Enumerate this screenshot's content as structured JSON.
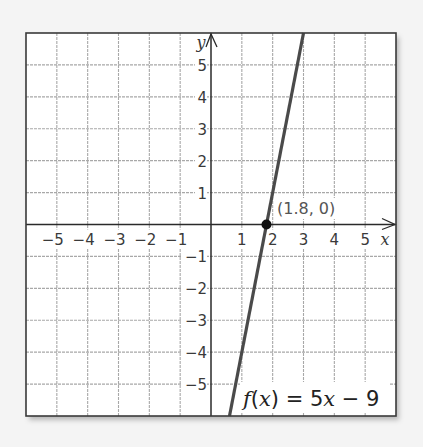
{
  "chart_data": {
    "type": "line",
    "title": "",
    "xlabel": "x",
    "ylabel": "y",
    "xlim": [
      -6,
      6
    ],
    "ylim": [
      -6,
      6
    ],
    "grid": true,
    "x_ticks": [
      -5,
      -4,
      -3,
      -2,
      -1,
      1,
      2,
      3,
      4,
      5
    ],
    "y_ticks": [
      5,
      4,
      3,
      2,
      1,
      -1,
      -2,
      -3,
      -4,
      -5
    ],
    "x_tick_labels": [
      "−5",
      "−4",
      "−3",
      "−2",
      "−1",
      "1",
      "2",
      "3",
      "4",
      "5"
    ],
    "y_tick_labels": [
      "5",
      "4",
      "3",
      "2",
      "1",
      "−1",
      "−2",
      "−3",
      "−4",
      "−5"
    ],
    "series": [
      {
        "name": "f(x) = 5x − 9",
        "equation": "f(x) = 5x - 9",
        "slope": 5,
        "intercept": -9,
        "x": [
          0.6,
          3
        ],
        "y": [
          -6,
          6
        ]
      }
    ],
    "annotations": [
      {
        "type": "point",
        "x": 1.8,
        "y": 0,
        "label": "(1.8, 0)"
      }
    ]
  },
  "labels": {
    "x_axis": "x",
    "y_axis": "y",
    "point": "(1.8, 0)",
    "equation_f": "f",
    "equation_open": "(",
    "equation_x": "x",
    "equation_mid": ") = 5",
    "equation_x2": "x",
    "equation_tail": " − 9"
  },
  "colors": {
    "background": "#f4f4f4",
    "plot_background": "#ffffff",
    "grid": "#a8a8a8",
    "axis": "#2a2a2a",
    "line": "#4a4a4a",
    "point": "#111111",
    "border": "#3a3a3a"
  }
}
